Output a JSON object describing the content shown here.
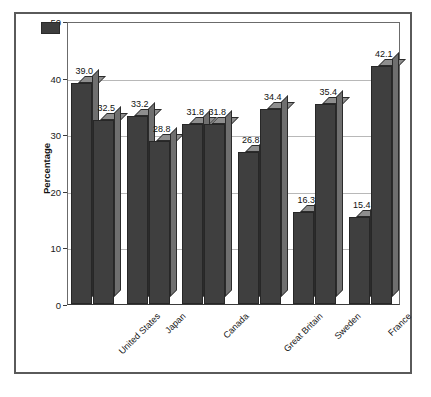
{
  "chart_data": {
    "type": "bar",
    "title": "",
    "subtitle": "",
    "xlabel": "",
    "ylabel": "Percentage",
    "ylim": [
      0,
      50
    ],
    "yticks": [
      0,
      10,
      20,
      30,
      40,
      50
    ],
    "ytick_labels": [
      "0",
      "10",
      "20",
      "30",
      "40",
      "50"
    ],
    "grid": true,
    "grid_axis": "y",
    "legend_position": "top-center",
    "categories": [
      "United States",
      "Japan",
      "Canada",
      "Great Britain",
      "Sweden",
      "France"
    ],
    "series": [
      {
        "name": "Personal laziness",
        "color": "#3f3f3f",
        "values": [
          39.0,
          33.2,
          31.8,
          26.8,
          16.3,
          15.4
        ],
        "value_labels": [
          "39.0",
          "33.2",
          "31.8",
          "26.8",
          "16.3",
          "15.4"
        ]
      },
      {
        "name": "Societal injustice",
        "color": "#3f3f3f",
        "values": [
          32.5,
          28.8,
          31.8,
          34.4,
          35.4,
          42.1
        ],
        "value_labels": [
          "32.5",
          "28.8",
          "31.8",
          "34.4",
          "35.4",
          "42.1"
        ]
      }
    ]
  },
  "legend": {
    "entries": [
      {
        "label": "Personal laziness"
      },
      {
        "label": "Societal injustice"
      }
    ]
  },
  "axes": {
    "y_title": "Percentage",
    "y_ticks": [
      "50",
      "40",
      "30",
      "20",
      "10",
      "0"
    ],
    "x_categories": [
      "United States",
      "Japan",
      "Canada",
      "Great Britain",
      "Sweden",
      "France"
    ]
  },
  "colors": {
    "bar_front": "#3f3f3f",
    "bar_top": "#8e8e8e",
    "bar_side": "#6f6f6f",
    "gridline": "#b8b8b8",
    "frame": "#5a5a5a",
    "background": "#ffffff"
  }
}
